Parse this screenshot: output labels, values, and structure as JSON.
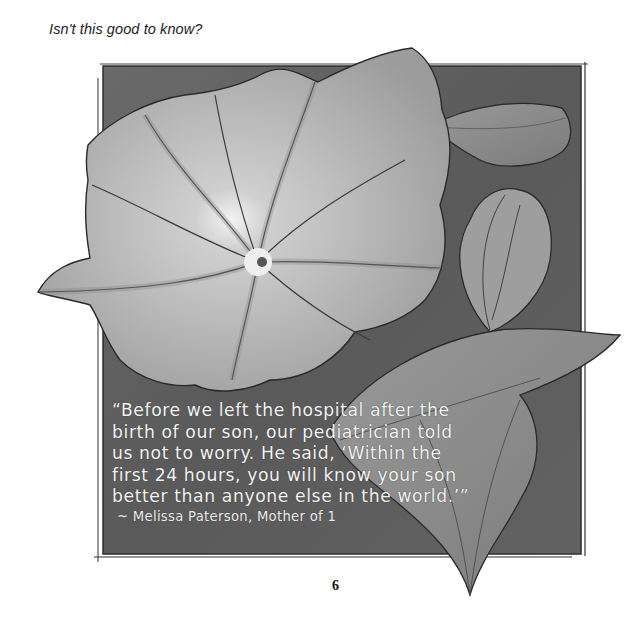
{
  "page": {
    "heading": "Isn't this good to know?",
    "page_number": "6"
  },
  "illustration": {
    "subject": "morning glory flower with leaves, watercolor",
    "colors": {
      "background_panel": "#5e5e5e",
      "petal_light": "#d2d2d2",
      "petal_mid": "#a9a9a9",
      "leaf": "#8a8a8a",
      "outline": "#2a2a2a"
    }
  },
  "quote": {
    "lines": [
      "“Before we left the hospital after the",
      "birth of our son, our pediatrician told",
      "us not to worry. He said, ‘Within the",
      "first 24 hours, you will know your son",
      "better than anyone else in the world.’”"
    ],
    "attribution": "~ Melissa Paterson, Mother of 1"
  }
}
